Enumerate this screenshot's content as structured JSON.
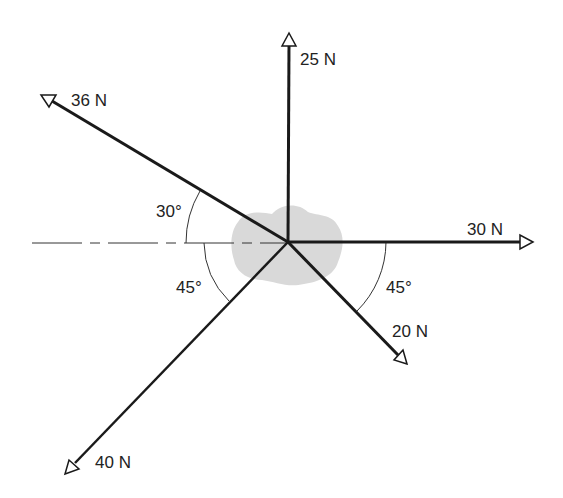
{
  "diagram": {
    "type": "free-body force diagram",
    "origin": [
      288,
      242
    ],
    "object_color": "#d9d9d9",
    "line_color": "#1a1a1a",
    "reference_line": "dashed horizontal line to the left",
    "forces": [
      {
        "label": "25 N",
        "magnitude": 25,
        "direction_deg": 90,
        "tip": [
          289,
          33
        ]
      },
      {
        "label": "36 N",
        "magnitude": 36,
        "direction_deg": 150,
        "tip": [
          45,
          97
        ]
      },
      {
        "label": "30 N",
        "magnitude": 30,
        "direction_deg": 0,
        "tip": [
          533,
          242
        ]
      },
      {
        "label": "20 N",
        "magnitude": 20,
        "direction_deg": -45,
        "tip": [
          405,
          363
        ]
      },
      {
        "label": "40 N",
        "magnitude": 40,
        "direction_deg": 225,
        "tip": [
          67,
          472
        ]
      }
    ],
    "angles": [
      {
        "label": "30°",
        "between": "36 N force and negative x-axis"
      },
      {
        "label": "45°",
        "between": "40 N force and negative x-axis"
      },
      {
        "label": "45°",
        "between": "20 N force and positive x-axis"
      }
    ]
  },
  "labels": {
    "f25": "25 N",
    "f36": "36 N",
    "f30": "30 N",
    "f20": "20 N",
    "f40": "40 N",
    "a30": "30°",
    "a45_left": "45°",
    "a45_right": "45°"
  }
}
